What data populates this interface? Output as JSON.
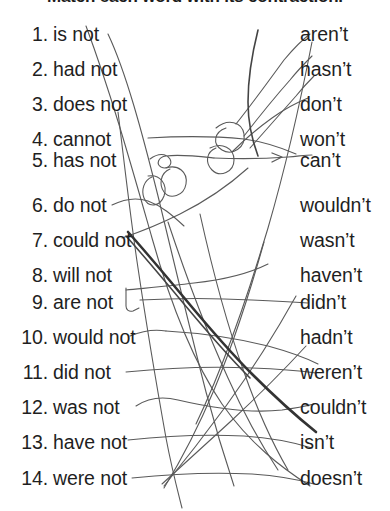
{
  "worksheet": {
    "title": "Match each word with its contraction.",
    "background_color": "#ffffff",
    "text_color": "#1f1f1f",
    "pencil_color": "#555555",
    "pencil_dark_color": "#3a3a3a"
  },
  "left_column": [
    {
      "number": "1.",
      "word": "is not"
    },
    {
      "number": "2.",
      "word": "had not"
    },
    {
      "number": "3.",
      "word": "does not"
    },
    {
      "number": "4.",
      "word": "cannot"
    },
    {
      "number": "5.",
      "word": "has not"
    },
    {
      "number": "6.",
      "word": "do not"
    },
    {
      "number": "7.",
      "word": "could not"
    },
    {
      "number": "8.",
      "word": "will not"
    },
    {
      "number": "9.",
      "word": "are not"
    },
    {
      "number": "10.",
      "word": "would not"
    },
    {
      "number": "11.",
      "word": "did not"
    },
    {
      "number": "12.",
      "word": "was not"
    },
    {
      "number": "13.",
      "word": "have not"
    },
    {
      "number": "14.",
      "word": "were not"
    }
  ],
  "right_column": [
    {
      "contraction": "aren’t"
    },
    {
      "contraction": "hasn’t"
    },
    {
      "contraction": "don’t"
    },
    {
      "contraction": "won’t"
    },
    {
      "contraction": "can’t"
    },
    {
      "contraction": "wouldn’t"
    },
    {
      "contraction": "wasn’t"
    },
    {
      "contraction": "haven’t"
    },
    {
      "contraction": "didn’t"
    },
    {
      "contraction": "hadn’t"
    },
    {
      "contraction": "weren’t"
    },
    {
      "contraction": "couldn’t"
    },
    {
      "contraction": "isn’t"
    },
    {
      "contraction": "doesn’t"
    }
  ]
}
